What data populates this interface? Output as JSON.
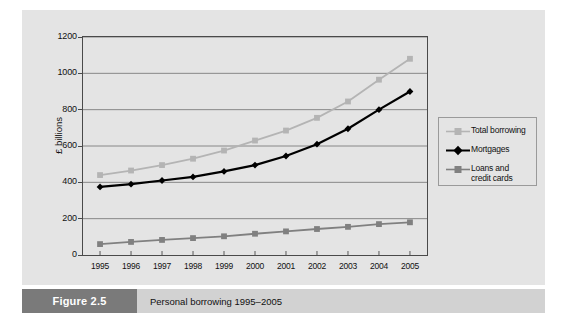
{
  "figure": {
    "tag": "Figure 2.5",
    "caption": "Personal borrowing 1995–2005"
  },
  "colors": {
    "panel_bg": "#e4e4e4",
    "caption_bar": "#d2d2d2",
    "caption_tag_bg": "#7a7a7a",
    "axis": "#4a4a4a",
    "gridline": "#6e6e6e",
    "total_borrowing": "#b4b4b4",
    "mortgages": "#000000",
    "loans_and_credit_cards": "#808080"
  },
  "chart_data": {
    "type": "line",
    "title": "Personal borrowing 1995–2005",
    "xlabel": "",
    "ylabel": "£ billions",
    "x": [
      1995,
      1996,
      1997,
      1998,
      1999,
      2000,
      2001,
      2002,
      2003,
      2004,
      2005
    ],
    "categories": [
      "1995",
      "1996",
      "1997",
      "1998",
      "1999",
      "2000",
      "2001",
      "2002",
      "2003",
      "2004",
      "2005"
    ],
    "ylim": [
      0,
      1200
    ],
    "yticks": [
      0,
      200,
      400,
      600,
      800,
      1000,
      1200
    ],
    "ytick_labels": [
      "0",
      "200",
      "400",
      "600",
      "800",
      "1000",
      "1200"
    ],
    "grid": "horizontal",
    "legend_position": "right",
    "series": [
      {
        "name": "Total borrowing",
        "color": "#b4b4b4",
        "marker": "square",
        "values": [
          440,
          465,
          495,
          530,
          575,
          630,
          685,
          755,
          845,
          965,
          1080
        ]
      },
      {
        "name": "Mortgages",
        "color": "#000000",
        "marker": "diamond",
        "values": [
          375,
          390,
          410,
          430,
          460,
          495,
          545,
          610,
          695,
          800,
          900
        ]
      },
      {
        "name": "Loans and credit cards",
        "color": "#808080",
        "marker": "square",
        "values": [
          60,
          72,
          83,
          93,
          103,
          117,
          130,
          143,
          155,
          170,
          180
        ]
      }
    ]
  },
  "legend": {
    "entries": [
      {
        "label": "Total borrowing",
        "label_line2": ""
      },
      {
        "label": "Mortgages",
        "label_line2": ""
      },
      {
        "label": "Loans and",
        "label_line2": "credit cards"
      }
    ]
  }
}
